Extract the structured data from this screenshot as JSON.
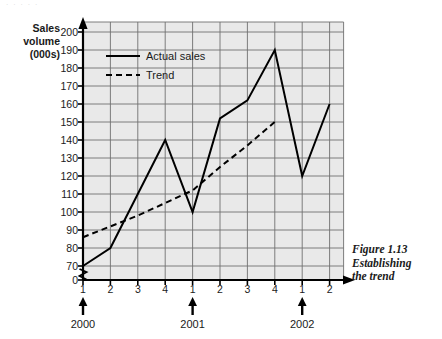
{
  "scan_artifact_text": "·  ·    ·  ·  ·",
  "axis": {
    "y_title_lines": [
      "Sales",
      "volume",
      "(000s)"
    ],
    "y_ticks": [
      0,
      70,
      80,
      90,
      100,
      110,
      120,
      130,
      140,
      150,
      160,
      170,
      180,
      190,
      200
    ],
    "y_break_between": [
      0,
      70
    ],
    "x_tick_labels": [
      "1",
      "2",
      "3",
      "4",
      "1",
      "2",
      "3",
      "4",
      "1",
      "2"
    ],
    "year_groups": [
      {
        "label": "2000",
        "at_tick_index": 0
      },
      {
        "label": "2001",
        "at_tick_index": 4
      },
      {
        "label": "2002",
        "at_tick_index": 8
      }
    ]
  },
  "legend": {
    "entries": [
      {
        "label": "Actual sales",
        "style": "solid"
      },
      {
        "label": "Trend",
        "style": "dashed"
      }
    ]
  },
  "caption": {
    "lines": [
      "Figure 1.13",
      "Establishing",
      "the trend"
    ]
  },
  "colors": {
    "plot_background": "#e9e9e9",
    "gridline": "#6f6f6f",
    "axis": "#000000",
    "series_line": "#000000",
    "text": "#1a1a1a"
  },
  "chart_data": {
    "type": "line",
    "title": "Figure 1.13 Establishing the trend",
    "xlabel": "",
    "ylabel": "Sales volume (000s)",
    "ylim": [
      70,
      200
    ],
    "y_axis_break": true,
    "grid": true,
    "legend_position": "top-left-inside",
    "categories": [
      "2000 Q1",
      "2000 Q2",
      "2000 Q3",
      "2000 Q4",
      "2001 Q1",
      "2001 Q2",
      "2001 Q3",
      "2001 Q4",
      "2002 Q1",
      "2002 Q2"
    ],
    "x": [
      1,
      2,
      3,
      4,
      5,
      6,
      7,
      8,
      9,
      10
    ],
    "series": [
      {
        "name": "Actual sales",
        "style": "solid",
        "values": [
          70,
          80,
          110,
          140,
          100,
          152,
          162,
          190,
          120,
          160
        ]
      },
      {
        "name": "Trend",
        "style": "dashed",
        "values": [
          86,
          92,
          98,
          105,
          112,
          125,
          137,
          150,
          null,
          null
        ]
      }
    ]
  }
}
